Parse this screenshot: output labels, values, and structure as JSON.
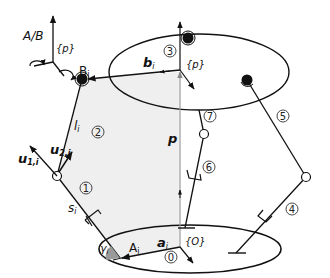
{
  "diagram": {
    "legend": {
      "joint_type_label": "A/B",
      "frame_label": "{p}"
    },
    "platform": {
      "frame_label": "{p}",
      "body_number": "3",
      "anchor_label": "B",
      "anchor_subscript": "i",
      "vector_label": "b",
      "vector_subscript": "i"
    },
    "base": {
      "frame_label": "{O}",
      "body_number": "0",
      "anchor_label": "A",
      "anchor_subscript": "i",
      "vector_label": "a",
      "vector_subscript": "i",
      "angle_label": "γ",
      "angle_subscript": "i"
    },
    "position_vector": {
      "label": "p"
    },
    "leg_left": {
      "lower_body_number": "1",
      "upper_body_number": "2",
      "lower_length_label": "s",
      "lower_length_subscript": "i",
      "upper_length_label": "l",
      "upper_length_subscript": "i",
      "axis1_label": "u",
      "axis1_subscript": "1,i",
      "axis2_label": "u",
      "axis2_subscript": "2,i"
    },
    "leg_right": {
      "lower_body_number": "4",
      "upper_body_number": "5"
    },
    "leg_middle": {
      "lower_body_number": "6",
      "upper_body_number": "7"
    },
    "colors": {
      "line": "#111111",
      "shade": "#e8e8e8",
      "p_vector": "#999999",
      "angle_fill": "#9a9a9a"
    }
  }
}
